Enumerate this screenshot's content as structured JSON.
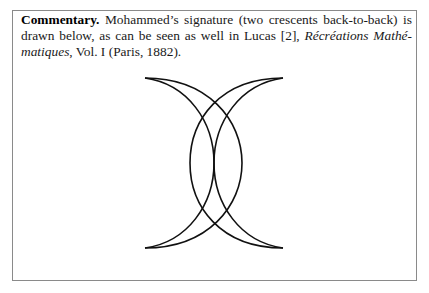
{
  "commentary": {
    "label": "Commentary.",
    "text_1": " Mohammed’s signature (two crescents back-to-back) is drawn below, as can be seen as well in Lucas [2], ",
    "book_title": "Récréations Mathé-matiques",
    "text_2": ", Vol. I (Paris, 1882)."
  },
  "figure": {
    "stroke_color": "#111111"
  }
}
